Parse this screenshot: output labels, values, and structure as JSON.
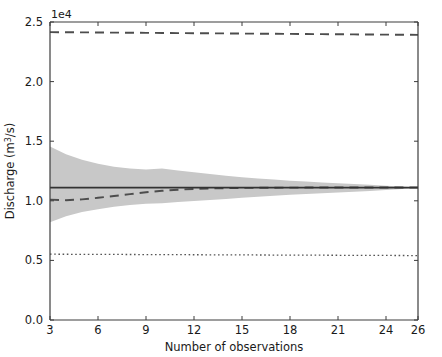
{
  "chart_data": {
    "type": "line",
    "title": "",
    "xlabel": "Number of observations",
    "ylabel": "Discharge (m³/s)",
    "y_offset_label": "1e4",
    "xlim": [
      3,
      26
    ],
    "ylim": [
      0.0,
      25000.0
    ],
    "xticks": [
      3,
      6,
      9,
      12,
      15,
      18,
      21,
      24,
      26
    ],
    "xtick_labels": [
      "3",
      "6",
      "9",
      "12",
      "15",
      "18",
      "21",
      "24",
      "26"
    ],
    "yticks": [
      0.0,
      5000.0,
      10000.0,
      15000.0,
      20000.0,
      25000.0
    ],
    "ytick_labels": [
      "0.0",
      "0.5",
      "1.0",
      "1.5",
      "2.0",
      "2.5"
    ],
    "grid": false,
    "legend": "none",
    "x": [
      3,
      4,
      5,
      6,
      7,
      8,
      9,
      10,
      11,
      12,
      13,
      14,
      15,
      16,
      17,
      18,
      19,
      20,
      21,
      22,
      23,
      24,
      25,
      26
    ],
    "series": [
      {
        "name": "upper reference line",
        "style": "dashed",
        "color": "#4d4d4d",
        "values": [
          24150,
          24140,
          24130,
          24120,
          24110,
          24100,
          24090,
          24080,
          24070,
          24060,
          24050,
          24040,
          24030,
          24020,
          24010,
          24000,
          23990,
          23980,
          23970,
          23960,
          23950,
          23940,
          23930,
          23920
        ]
      },
      {
        "name": "sample mean estimate",
        "style": "dashed",
        "color": "#4d4d4d",
        "values": [
          10100,
          10050,
          10120,
          10250,
          10400,
          10560,
          10720,
          10840,
          10930,
          10990,
          11030,
          11060,
          11080,
          11090,
          11100,
          11105,
          11110,
          11115,
          11118,
          11120,
          11120,
          11118,
          11115,
          11110
        ]
      },
      {
        "name": "population mean",
        "style": "solid",
        "color": "#333333",
        "values": [
          11100,
          11100,
          11100,
          11100,
          11100,
          11100,
          11100,
          11100,
          11100,
          11100,
          11100,
          11100,
          11100,
          11100,
          11100,
          11100,
          11100,
          11100,
          11100,
          11100,
          11100,
          11100,
          11100,
          11100
        ]
      },
      {
        "name": "lower reference line",
        "style": "dotted",
        "color": "#555555",
        "values": [
          5520,
          5515,
          5510,
          5505,
          5500,
          5495,
          5490,
          5485,
          5480,
          5475,
          5470,
          5465,
          5460,
          5455,
          5450,
          5445,
          5440,
          5435,
          5430,
          5425,
          5420,
          5415,
          5410,
          5405
        ]
      }
    ],
    "band": {
      "name": "confidence interval",
      "fill_color": "#c8c8c8",
      "upper": [
        14550,
        13900,
        13450,
        13100,
        12850,
        12700,
        12620,
        12700,
        12550,
        12400,
        12250,
        12100,
        11980,
        11870,
        11780,
        11690,
        11610,
        11540,
        11470,
        11400,
        11340,
        11270,
        11190,
        11110
      ],
      "lower": [
        8200,
        8700,
        9050,
        9300,
        9500,
        9650,
        9760,
        9800,
        9890,
        9980,
        10070,
        10160,
        10250,
        10340,
        10420,
        10500,
        10570,
        10640,
        10700,
        10760,
        10830,
        10900,
        11000,
        11110
      ]
    },
    "colors": {
      "background": "#ffffff",
      "axis": "#3c3c3c",
      "band_fill": "#c8c8c8",
      "solid_line": "#333333",
      "dashed_line": "#4d4d4d",
      "dotted_line": "#555555",
      "text": "#1a1a1a"
    },
    "axes_box": {
      "left": 50,
      "right": 418,
      "top": 22,
      "bottom": 320
    }
  }
}
